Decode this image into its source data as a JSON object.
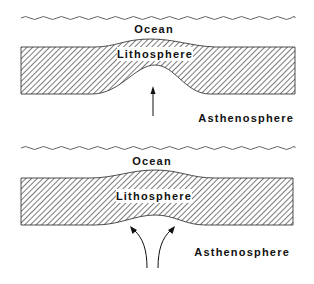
{
  "figure": {
    "panels": [
      {
        "id": "top",
        "labels": {
          "ocean": "Ocean",
          "lithosphere": "Lithosphere",
          "asthenosphere": "Asthenosphere"
        },
        "arrow_type": "single upward straight arrow",
        "deformation": "lithosphere bulges upward with thinned base"
      },
      {
        "id": "bottom",
        "labels": {
          "ocean": "Ocean",
          "lithosphere": "Lithosphere",
          "asthenosphere": "Asthenosphere"
        },
        "arrow_type": "two diverging curved arrows",
        "deformation": "lithosphere gently uplifted, uniform thickness"
      }
    ]
  },
  "colors": {
    "ink": "#111111",
    "hatch": "#333333",
    "background": "#ffffff"
  }
}
